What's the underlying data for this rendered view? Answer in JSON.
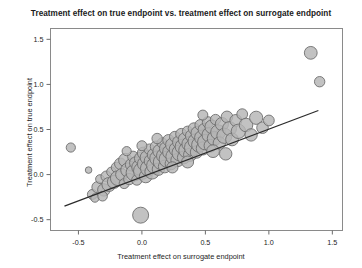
{
  "chart_data": {
    "type": "scatter",
    "title": "Treatment effect on true endpoint vs. treatment effect on surrogate endpoint",
    "xlabel": "Treatment effect on surrogate endpoint",
    "ylabel": "Treatment effect on true endpoint",
    "xlim": [
      -0.72,
      1.58
    ],
    "ylim": [
      -0.62,
      1.62
    ],
    "xticks": [
      -0.5,
      0.0,
      0.5,
      1.0,
      1.5
    ],
    "xticklabels": [
      "-0.5",
      "0.0",
      "0.5",
      "1.0",
      "1.5"
    ],
    "yticks": [
      -0.5,
      0.0,
      0.5,
      1.0,
      1.5
    ],
    "yticklabels": [
      "-0.5",
      "0.0",
      "0.5",
      "1.0",
      "1.5"
    ],
    "grid": false,
    "legend": null,
    "marker_shape": "circle",
    "marker_fill": "#b4b4b4",
    "marker_edge": "#6e6e6e",
    "marker_size_encodes": "study weight",
    "regression_line": {
      "color": "#2b2b2b",
      "x_start": -0.61,
      "y_start": -0.35,
      "x_end": 1.39,
      "y_end": 0.71
    },
    "points": [
      {
        "x": -0.56,
        "y": 0.3,
        "r": 4.6
      },
      {
        "x": -0.42,
        "y": 0.05,
        "r": 3.3
      },
      {
        "x": -0.01,
        "y": -0.45,
        "r": 8.0
      },
      {
        "x": 0.66,
        "y": 0.23,
        "r": 6.2
      },
      {
        "x": 1.33,
        "y": 1.35,
        "r": 6.4
      },
      {
        "x": 1.4,
        "y": 1.03,
        "r": 5.2
      },
      {
        "x": -0.39,
        "y": -0.22,
        "r": 5.0
      },
      {
        "x": -0.35,
        "y": -0.14,
        "r": 5.6
      },
      {
        "x": -0.33,
        "y": -0.05,
        "r": 4.4
      },
      {
        "x": -0.3,
        "y": -0.17,
        "r": 6.2
      },
      {
        "x": -0.28,
        "y": -0.02,
        "r": 5.4
      },
      {
        "x": -0.26,
        "y": -0.11,
        "r": 7.0
      },
      {
        "x": -0.24,
        "y": 0.03,
        "r": 4.8
      },
      {
        "x": -0.22,
        "y": -0.08,
        "r": 6.6
      },
      {
        "x": -0.2,
        "y": 0.08,
        "r": 5.2
      },
      {
        "x": -0.19,
        "y": -0.04,
        "r": 7.4
      },
      {
        "x": -0.17,
        "y": 0.12,
        "r": 5.8
      },
      {
        "x": -0.16,
        "y": 0.0,
        "r": 6.0
      },
      {
        "x": -0.14,
        "y": -0.1,
        "r": 5.0
      },
      {
        "x": -0.13,
        "y": 0.16,
        "r": 6.8
      },
      {
        "x": -0.11,
        "y": 0.05,
        "r": 7.2
      },
      {
        "x": -0.1,
        "y": -0.05,
        "r": 5.6
      },
      {
        "x": -0.08,
        "y": 0.11,
        "r": 6.4
      },
      {
        "x": -0.07,
        "y": 0.2,
        "r": 5.4
      },
      {
        "x": -0.06,
        "y": 0.02,
        "r": 8.2
      },
      {
        "x": -0.05,
        "y": 0.13,
        "r": 6.0
      },
      {
        "x": -0.04,
        "y": -0.06,
        "r": 5.2
      },
      {
        "x": -0.02,
        "y": 0.08,
        "r": 7.6
      },
      {
        "x": -0.01,
        "y": 0.18,
        "r": 6.2
      },
      {
        "x": 0.0,
        "y": 0.04,
        "r": 8.4
      },
      {
        "x": 0.01,
        "y": 0.24,
        "r": 5.8
      },
      {
        "x": 0.02,
        "y": 0.12,
        "r": 7.0
      },
      {
        "x": 0.03,
        "y": -0.02,
        "r": 6.4
      },
      {
        "x": 0.04,
        "y": 0.19,
        "r": 6.8
      },
      {
        "x": 0.05,
        "y": 0.07,
        "r": 7.8
      },
      {
        "x": 0.06,
        "y": 0.28,
        "r": 5.4
      },
      {
        "x": 0.07,
        "y": 0.15,
        "r": 6.6
      },
      {
        "x": 0.08,
        "y": 0.03,
        "r": 7.2
      },
      {
        "x": 0.09,
        "y": 0.22,
        "r": 6.0
      },
      {
        "x": 0.1,
        "y": 0.1,
        "r": 8.0
      },
      {
        "x": 0.11,
        "y": 0.31,
        "r": 5.6
      },
      {
        "x": 0.12,
        "y": 0.18,
        "r": 7.4
      },
      {
        "x": 0.13,
        "y": 0.06,
        "r": 6.2
      },
      {
        "x": 0.14,
        "y": 0.26,
        "r": 6.8
      },
      {
        "x": 0.15,
        "y": 0.14,
        "r": 7.6
      },
      {
        "x": 0.16,
        "y": 0.35,
        "r": 5.2
      },
      {
        "x": 0.17,
        "y": 0.21,
        "r": 7.0
      },
      {
        "x": 0.18,
        "y": 0.09,
        "r": 6.4
      },
      {
        "x": 0.19,
        "y": 0.29,
        "r": 6.6
      },
      {
        "x": 0.2,
        "y": 0.17,
        "r": 8.2
      },
      {
        "x": 0.21,
        "y": 0.38,
        "r": 5.8
      },
      {
        "x": 0.22,
        "y": 0.25,
        "r": 7.2
      },
      {
        "x": 0.23,
        "y": 0.12,
        "r": 6.0
      },
      {
        "x": 0.24,
        "y": 0.33,
        "r": 6.8
      },
      {
        "x": 0.25,
        "y": 0.2,
        "r": 7.8
      },
      {
        "x": 0.26,
        "y": 0.42,
        "r": 5.4
      },
      {
        "x": 0.27,
        "y": 0.28,
        "r": 7.0
      },
      {
        "x": 0.28,
        "y": 0.16,
        "r": 6.6
      },
      {
        "x": 0.29,
        "y": 0.36,
        "r": 6.2
      },
      {
        "x": 0.3,
        "y": 0.24,
        "r": 8.0
      },
      {
        "x": 0.31,
        "y": 0.45,
        "r": 5.6
      },
      {
        "x": 0.32,
        "y": 0.31,
        "r": 7.4
      },
      {
        "x": 0.33,
        "y": 0.19,
        "r": 6.4
      },
      {
        "x": 0.34,
        "y": 0.39,
        "r": 6.8
      },
      {
        "x": 0.35,
        "y": 0.27,
        "r": 7.6
      },
      {
        "x": 0.36,
        "y": 0.48,
        "r": 5.2
      },
      {
        "x": 0.37,
        "y": 0.34,
        "r": 7.0
      },
      {
        "x": 0.38,
        "y": 0.22,
        "r": 6.6
      },
      {
        "x": 0.39,
        "y": 0.43,
        "r": 6.0
      },
      {
        "x": 0.4,
        "y": 0.3,
        "r": 8.2
      },
      {
        "x": 0.41,
        "y": 0.51,
        "r": 5.8
      },
      {
        "x": 0.42,
        "y": 0.37,
        "r": 7.2
      },
      {
        "x": 0.43,
        "y": 0.25,
        "r": 6.2
      },
      {
        "x": 0.44,
        "y": 0.46,
        "r": 6.8
      },
      {
        "x": 0.45,
        "y": 0.33,
        "r": 7.4
      },
      {
        "x": 0.46,
        "y": 0.55,
        "r": 5.4
      },
      {
        "x": 0.47,
        "y": 0.41,
        "r": 7.0
      },
      {
        "x": 0.48,
        "y": 0.29,
        "r": 6.6
      },
      {
        "x": 0.49,
        "y": 0.5,
        "r": 6.0
      },
      {
        "x": 0.5,
        "y": 0.36,
        "r": 7.8
      },
      {
        "x": 0.52,
        "y": 0.58,
        "r": 5.6
      },
      {
        "x": 0.53,
        "y": 0.44,
        "r": 7.2
      },
      {
        "x": 0.54,
        "y": 0.32,
        "r": 6.4
      },
      {
        "x": 0.55,
        "y": 0.53,
        "r": 6.8
      },
      {
        "x": 0.57,
        "y": 0.4,
        "r": 7.0
      },
      {
        "x": 0.58,
        "y": 0.61,
        "r": 5.2
      },
      {
        "x": 0.6,
        "y": 0.47,
        "r": 7.4
      },
      {
        "x": 0.61,
        "y": 0.35,
        "r": 6.2
      },
      {
        "x": 0.63,
        "y": 0.56,
        "r": 6.6
      },
      {
        "x": 0.65,
        "y": 0.43,
        "r": 7.6
      },
      {
        "x": 0.67,
        "y": 0.64,
        "r": 5.8
      },
      {
        "x": 0.69,
        "y": 0.51,
        "r": 7.0
      },
      {
        "x": 0.71,
        "y": 0.39,
        "r": 6.4
      },
      {
        "x": 0.74,
        "y": 0.6,
        "r": 6.0
      },
      {
        "x": 0.76,
        "y": 0.48,
        "r": 7.2
      },
      {
        "x": 0.79,
        "y": 0.67,
        "r": 5.4
      },
      {
        "x": 0.82,
        "y": 0.55,
        "r": 6.8
      },
      {
        "x": 0.86,
        "y": 0.44,
        "r": 6.2
      },
      {
        "x": 0.9,
        "y": 0.63,
        "r": 6.6
      },
      {
        "x": 0.95,
        "y": 0.52,
        "r": 5.8
      },
      {
        "x": 1.0,
        "y": 0.6,
        "r": 5.4
      },
      {
        "x": -0.37,
        "y": -0.26,
        "r": 4.2
      },
      {
        "x": -0.31,
        "y": -0.24,
        "r": 4.8
      },
      {
        "x": -0.12,
        "y": 0.26,
        "r": 4.6
      },
      {
        "x": 0.0,
        "y": 0.32,
        "r": 5.0
      },
      {
        "x": 0.12,
        "y": 0.4,
        "r": 5.2
      },
      {
        "x": 0.24,
        "y": 0.08,
        "r": 5.6
      },
      {
        "x": 0.36,
        "y": 0.14,
        "r": 6.0
      },
      {
        "x": 0.48,
        "y": 0.66,
        "r": 5.0
      },
      {
        "x": 0.56,
        "y": 0.26,
        "r": 6.4
      }
    ]
  }
}
